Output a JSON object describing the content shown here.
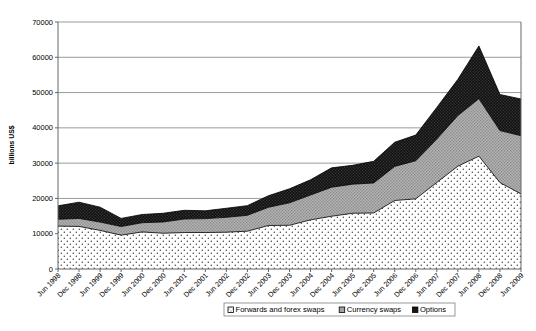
{
  "chart_data": {
    "type": "area",
    "stacked": true,
    "title": "",
    "xlabel": "",
    "ylabel": "billions US$",
    "ylim": [
      0,
      70000
    ],
    "ytick_step": 10000,
    "yticks": [
      "0",
      "10000",
      "20000",
      "30000",
      "40000",
      "50000",
      "60000",
      "70000"
    ],
    "grid": true,
    "legend_position": "bottom",
    "categories": [
      "Jun 1998",
      "Dec 1998",
      "Jun 1999",
      "Dec 1999",
      "Jun 2000",
      "Dec 2000",
      "Jun 2001",
      "Dec 2001",
      "Jun 2002",
      "Dec 2002",
      "Jun 2003",
      "Dec 2003",
      "Jun 2004",
      "Dec 2004",
      "Jun 2005",
      "Dec 2005",
      "Jun 2006",
      "Dec 2006",
      "Jun 2007",
      "Dec 2007",
      "Jun 2008",
      "Dec 2008",
      "Jun 2009"
    ],
    "series": [
      {
        "name": "Forwards and forex swaps",
        "pattern": "light-dots",
        "color": "#ffffff",
        "values": [
          12149,
          12063,
          10945,
          9593,
          10504,
          10134,
          10336,
          10336,
          10427,
          10719,
          12332,
          12387,
          13926,
          14951,
          15801,
          15873,
          19415,
          19882,
          24530,
          29144,
          31966,
          24494,
          21266
        ]
      },
      {
        "name": "Currency swaps",
        "pattern": "mid-gray",
        "color": "#a8a8a8",
        "values": [
          1947,
          2253,
          2350,
          2444,
          2605,
          3194,
          3832,
          3942,
          4220,
          4503,
          5159,
          6371,
          7033,
          8223,
          8236,
          8504,
          9669,
          10792,
          12312,
          14347,
          16307,
          14725,
          16509
        ]
      },
      {
        "name": "Options",
        "pattern": "dark-dots",
        "color": "#1c1c1c",
        "values": [
          3806,
          4623,
          4231,
          2307,
          2338,
          2470,
          2470,
          2214,
          2566,
          2738,
          3282,
          3975,
          4324,
          5489,
          5346,
          6146,
          6840,
          7285,
          8957,
          10254,
          14940,
          10226,
          10410
        ]
      }
    ],
    "legend": [
      {
        "label": "Forwards and forex swaps",
        "swatch": "light-dots"
      },
      {
        "label": "Currency swaps",
        "swatch": "mid-gray"
      },
      {
        "label": "Options",
        "swatch": "dark-dots"
      }
    ],
    "plot_area": {
      "left": 58,
      "right": 521,
      "top": 22,
      "bottom": 269
    }
  }
}
